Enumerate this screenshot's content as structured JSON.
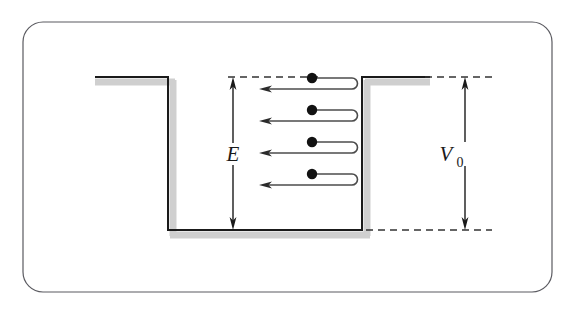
{
  "figure": {
    "kind": "physics-diagram",
    "background_color": "#ffffff",
    "border": {
      "name": "rounded-frame",
      "color": "#5a5a60",
      "stroke_width": 1.2,
      "x": 23,
      "y": 22,
      "width": 529,
      "height": 270,
      "radius": 20
    },
    "well": {
      "line_color": "#1a1a1a",
      "line_width": 2.0,
      "shadow_color": "#cfcfcf",
      "shadow_width": 6,
      "shadow_offset_x": 4,
      "shadow_offset_y": 5,
      "left_ledge_x_start": 95,
      "left_wall_x": 168,
      "right_wall_x": 362,
      "right_ledge_x_end": 430,
      "top_y": 77,
      "bottom_y": 230
    },
    "dashed_guides": {
      "color": "#333333",
      "stroke_width": 1.3,
      "dash_pattern": "7,5",
      "top_left": {
        "x1": 228,
        "y": 77,
        "x2": 318
      },
      "top_right": {
        "x1": 425,
        "y": 77,
        "x2": 492
      },
      "bottom_right": {
        "x1": 366,
        "y": 230,
        "x2": 492
      }
    },
    "measure_E": {
      "label": "E",
      "label_x": 233,
      "label_y": 159,
      "line_x": 233,
      "top_y": 77,
      "bottom_y": 230,
      "color": "#1a1a1a",
      "arrow_both_ends": true
    },
    "measure_V0": {
      "label": "V",
      "subscript": "0",
      "label_x": 455,
      "label_y": 160,
      "line_x": 465,
      "top_y": 77,
      "bottom_y": 230,
      "color": "#1a1a1a",
      "arrow_both_ends": true
    },
    "particles": {
      "count": 4,
      "dot_color": "#121212",
      "dot_radius": 5.2,
      "path_color": "#4c4c4c",
      "path_width": 1.6,
      "dot_x": 312,
      "incoming_end_x": 358,
      "outgoing_start_x": 358,
      "outgoing_end_x": 262,
      "loop_radius": 5.5,
      "tracks": [
        {
          "name": "particle-track-1",
          "incoming_y": 78,
          "outgoing_y": 89
        },
        {
          "name": "particle-track-2",
          "incoming_y": 110,
          "outgoing_y": 121
        },
        {
          "name": "particle-track-3",
          "incoming_y": 142,
          "outgoing_y": 153
        },
        {
          "name": "particle-track-4",
          "incoming_y": 174,
          "outgoing_y": 185
        }
      ]
    }
  }
}
